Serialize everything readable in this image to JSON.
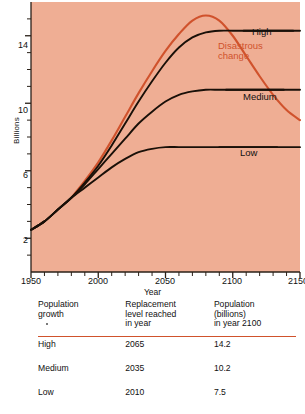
{
  "figure": {
    "background_color": "#EFAE94",
    "accent_color": "#D0522C",
    "line_color": "#1a1008"
  },
  "chart_data": {
    "type": "line",
    "title": "",
    "xlabel": "Year",
    "ylabel": "Billions",
    "xlim": [
      1950,
      2150
    ],
    "ylim": [
      0,
      16
    ],
    "x_ticks_major": [
      1950,
      2000,
      2050,
      2100,
      2150
    ],
    "x_tick_labels": [
      "1950",
      "2000",
      "2050",
      "2100",
      "2150"
    ],
    "x_tick_minor_step": 10,
    "y_ticks_major": [
      2,
      6,
      10,
      14
    ],
    "y_tick_labels": [
      "2",
      "6",
      "10",
      "14"
    ],
    "y_tick_minor_step": 1,
    "grid": false,
    "legend_position": "inline-right",
    "series": [
      {
        "name": "Disastrous change",
        "color": "#D0522C",
        "label": "Disastrous\nchange",
        "label_line1": "Disastrous",
        "label_line2": "change",
        "points": [
          [
            1980,
            4.4
          ],
          [
            1990,
            5.4
          ],
          [
            2000,
            6.5
          ],
          [
            2010,
            7.8
          ],
          [
            2020,
            9.2
          ],
          [
            2030,
            10.6
          ],
          [
            2040,
            11.9
          ],
          [
            2050,
            13.1
          ],
          [
            2060,
            14.1
          ],
          [
            2070,
            14.9
          ],
          [
            2080,
            15.2
          ],
          [
            2090,
            14.9
          ],
          [
            2100,
            14.0
          ],
          [
            2110,
            12.8
          ],
          [
            2120,
            11.6
          ],
          [
            2130,
            10.5
          ],
          [
            2140,
            9.6
          ],
          [
            2150,
            9.0
          ]
        ]
      },
      {
        "name": "High",
        "color": "#1a1008",
        "label": "High",
        "points": [
          [
            1950,
            2.5
          ],
          [
            1960,
            3.0
          ],
          [
            1970,
            3.7
          ],
          [
            1980,
            4.4
          ],
          [
            1990,
            5.3
          ],
          [
            2000,
            6.3
          ],
          [
            2010,
            7.5
          ],
          [
            2020,
            8.8
          ],
          [
            2030,
            10.1
          ],
          [
            2040,
            11.3
          ],
          [
            2050,
            12.4
          ],
          [
            2060,
            13.3
          ],
          [
            2070,
            13.9
          ],
          [
            2080,
            14.2
          ],
          [
            2090,
            14.3
          ],
          [
            2100,
            14.3
          ],
          [
            2110,
            14.3
          ],
          [
            2120,
            14.3
          ],
          [
            2130,
            14.3
          ],
          [
            2140,
            14.3
          ],
          [
            2150,
            14.3
          ]
        ]
      },
      {
        "name": "Medium",
        "color": "#1a1008",
        "label": "Medium",
        "points": [
          [
            1950,
            2.5
          ],
          [
            1960,
            3.0
          ],
          [
            1970,
            3.7
          ],
          [
            1980,
            4.4
          ],
          [
            1990,
            5.2
          ],
          [
            2000,
            6.1
          ],
          [
            2010,
            7.0
          ],
          [
            2020,
            7.9
          ],
          [
            2030,
            8.8
          ],
          [
            2040,
            9.5
          ],
          [
            2050,
            10.1
          ],
          [
            2060,
            10.5
          ],
          [
            2070,
            10.7
          ],
          [
            2080,
            10.8
          ],
          [
            2090,
            10.8
          ],
          [
            2100,
            10.8
          ],
          [
            2110,
            10.8
          ],
          [
            2120,
            10.8
          ],
          [
            2130,
            10.8
          ],
          [
            2140,
            10.8
          ],
          [
            2150,
            10.8
          ]
        ]
      },
      {
        "name": "Low",
        "color": "#1a1008",
        "label": "Low",
        "points": [
          [
            1950,
            2.5
          ],
          [
            1960,
            3.0
          ],
          [
            1970,
            3.7
          ],
          [
            1980,
            4.4
          ],
          [
            1990,
            5.0
          ],
          [
            2000,
            5.6
          ],
          [
            2010,
            6.2
          ],
          [
            2020,
            6.7
          ],
          [
            2030,
            7.1
          ],
          [
            2040,
            7.3
          ],
          [
            2050,
            7.4
          ],
          [
            2060,
            7.4
          ],
          [
            2070,
            7.4
          ],
          [
            2080,
            7.4
          ],
          [
            2090,
            7.4
          ],
          [
            2100,
            7.4
          ],
          [
            2110,
            7.4
          ],
          [
            2120,
            7.4
          ],
          [
            2130,
            7.4
          ],
          [
            2140,
            7.4
          ],
          [
            2150,
            7.4
          ]
        ]
      }
    ]
  },
  "table": {
    "headers": {
      "col1_line1": "Population",
      "col1_line2": "growth",
      "col2_line1": "Replacement",
      "col2_line2": "level reached",
      "col2_line3": "in year",
      "col3_line1": "Population",
      "col3_line2": "(billions)",
      "col3_line3": "in year 2100"
    },
    "rows": [
      {
        "growth": "High",
        "replacement_year": "2065",
        "population_2100": "14.2"
      },
      {
        "growth": "Medium",
        "replacement_year": "2035",
        "population_2100": "10.2"
      },
      {
        "growth": "Low",
        "replacement_year": "2010",
        "population_2100": "7.5"
      }
    ]
  }
}
